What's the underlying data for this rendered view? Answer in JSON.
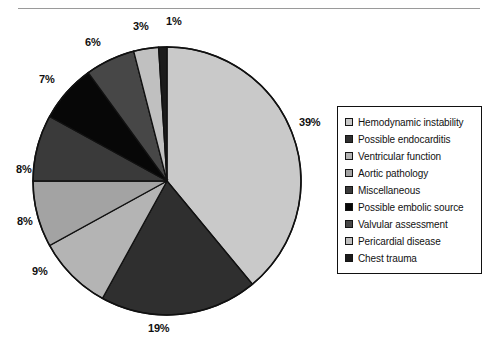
{
  "page": {
    "clipped_header_text": "",
    "background_color": "#ffffff"
  },
  "chart_data": {
    "type": "pie",
    "title": "",
    "subtitle": "",
    "xlabel": "",
    "ylabel": "",
    "legend_position": "right",
    "grid": false,
    "start_angle_deg": 0,
    "direction": "clockwise",
    "units": "percent",
    "categories": [
      "Hemodynamic instability",
      "Possible endocarditis",
      "Ventricular function",
      "Aortic pathology",
      "Miscellaneous",
      "Possible embolic source",
      "Valvular assessment",
      "Pericardial disease",
      "Chest trauma"
    ],
    "values": [
      39,
      19,
      9,
      8,
      8,
      7,
      6,
      3,
      1
    ],
    "data_labels": [
      "39%",
      "19%",
      "9%",
      "8%",
      "8%",
      "7%",
      "6%",
      "3%",
      "1%"
    ],
    "colors": [
      "#c9c9c9",
      "#2f2f2f",
      "#b4b4b4",
      "#a3a3a3",
      "#3a3a3a",
      "#070707",
      "#474747",
      "#c0c0c0",
      "#1b1b1b"
    ],
    "slice_border_color": "#111111"
  },
  "pie": {
    "center_x": 167,
    "center_y": 181,
    "radius": 134,
    "outline_color": "#111111",
    "labels": [
      {
        "text": "39%",
        "left": 299,
        "top": 116
      },
      {
        "text": "19%",
        "left": 148,
        "top": 322
      },
      {
        "text": "9%",
        "left": 32,
        "top": 265
      },
      {
        "text": "8%",
        "left": 17,
        "top": 215
      },
      {
        "text": "8%",
        "left": 16,
        "top": 163
      },
      {
        "text": "7%",
        "left": 39,
        "top": 73
      },
      {
        "text": "6%",
        "left": 85,
        "top": 36
      },
      {
        "text": "3%",
        "left": 133,
        "top": 20
      },
      {
        "text": "1%",
        "left": 166,
        "top": 15
      }
    ]
  },
  "legend": {
    "items": [
      {
        "label": "Hemodynamic instability",
        "color": "#c9c9c9"
      },
      {
        "label": "Possible endocarditis",
        "color": "#2f2f2f"
      },
      {
        "label": "Ventricular function",
        "color": "#b4b4b4"
      },
      {
        "label": "Aortic pathology",
        "color": "#a3a3a3"
      },
      {
        "label": "Miscellaneous",
        "color": "#3a3a3a"
      },
      {
        "label": "Possible embolic source",
        "color": "#070707"
      },
      {
        "label": "Valvular assessment",
        "color": "#474747"
      },
      {
        "label": "Pericardial disease",
        "color": "#c0c0c0"
      },
      {
        "label": "Chest trauma",
        "color": "#1b1b1b"
      }
    ]
  }
}
